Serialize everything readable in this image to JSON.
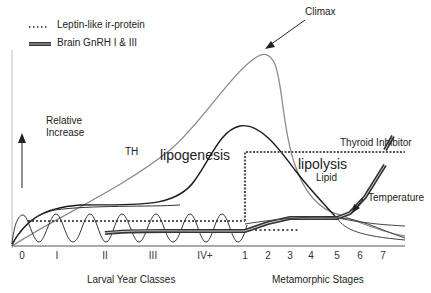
{
  "legend": [
    {
      "label": "Leptin-like ir-protein",
      "style": "dotted"
    },
    {
      "label": "Brain GnRH I & III",
      "style": "double-line"
    }
  ],
  "annotations": {
    "climax": "Climax",
    "relative_increase_line1": "Relative",
    "relative_increase_line2": "Increase",
    "th": "TH",
    "lipogenesis": "lipogenesis",
    "lipolysis": "lipolysis",
    "lipid": "Lipid",
    "thyroid_inhibitor": "Thyroid Inhibitor",
    "temperature": "Temperature"
  },
  "x_axis": {
    "larval_ticks": [
      "0",
      "I",
      "II",
      "III",
      "IV+"
    ],
    "metamorphic_ticks": [
      "1",
      "2",
      "3",
      "4",
      "5",
      "6",
      "7"
    ],
    "larval_label": "Larval Year Classes",
    "metamorphic_label": "Metamorphic Stages"
  },
  "colors": {
    "th_curve": "#8a8a8a",
    "lipid_curve": "#1a1a1a",
    "axis": "#555555",
    "text": "#222222"
  }
}
